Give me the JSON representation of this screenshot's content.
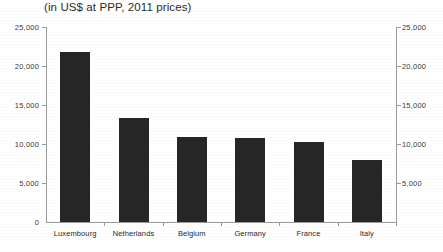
{
  "chart_data": {
    "type": "bar",
    "title": "(in US$ at PPP, 2011 prices)",
    "xlabel": "",
    "ylabel": "",
    "ylim": [
      0,
      25000
    ],
    "ytick_labels": [
      "25,000",
      "20,000",
      "15,000",
      "10,000",
      "5,000",
      "0"
    ],
    "ytick_values": [
      25000,
      20000,
      15000,
      10000,
      5000,
      0
    ],
    "dual_axis": true,
    "right_ytick_labels": [
      "25,000",
      "20,000",
      "15,000",
      "10,000",
      "5,000"
    ],
    "grid": false,
    "legend": "none",
    "bar_color": "#262626",
    "categories": [
      "Luxembourg",
      "Netherlands",
      "Belgium",
      "Germany",
      "France",
      "Italy"
    ],
    "values": [
      21800,
      13300,
      10900,
      10800,
      10200,
      8000
    ]
  },
  "axis": {
    "zero_label": "0"
  }
}
